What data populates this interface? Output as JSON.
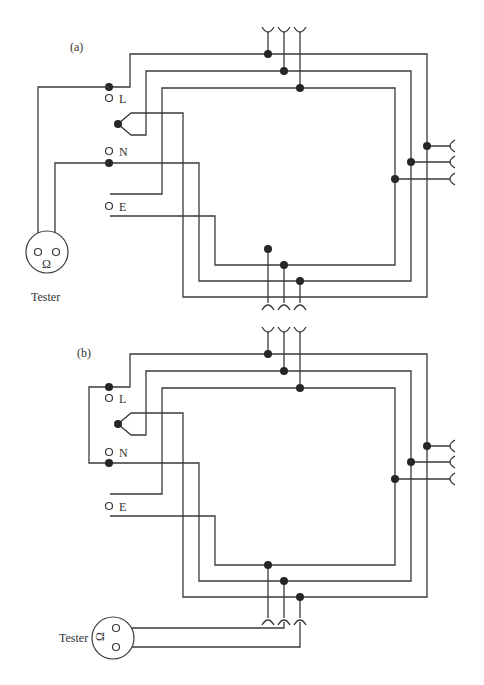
{
  "diagrams": [
    {
      "label": "(a)",
      "terminals": [
        "L",
        "N",
        "E"
      ],
      "tester_label": "Tester",
      "tester_symbol": "Ω",
      "description": "Ring circuit continuity test: tester connected across L and N at consumer unit"
    },
    {
      "label": "(b)",
      "terminals": [
        "L",
        "N",
        "E"
      ],
      "tester_label": "Tester",
      "tester_symbol": "Ω",
      "description": "Ring circuit test: L and N linked at consumer unit, tester connected at socket outlet"
    }
  ],
  "colors": {
    "wire": "#3a3a3a",
    "junction": "#262626",
    "background": "#ffffff"
  }
}
